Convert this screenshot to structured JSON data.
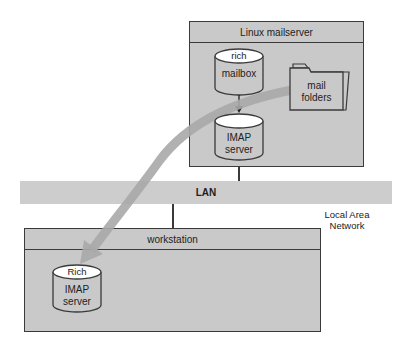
{
  "server": {
    "title": "Linux mailserver",
    "mailbox": {
      "top_label": "rich",
      "label": "mailbox"
    },
    "imap": {
      "line1": "IMAP",
      "line2": "server"
    },
    "folders": {
      "line1": "mail",
      "line2": "folders"
    }
  },
  "network": {
    "band_label": "LAN",
    "caption": "Local Area Network"
  },
  "workstation": {
    "title": "workstation",
    "imap": {
      "top_label": "Rich",
      "line1": "IMAP",
      "line2": "server"
    }
  },
  "colors": {
    "box_fill": "#c9c9c9",
    "border": "#3a3a3a",
    "lan_band": "#cdcdcd",
    "flow_arrow": "#a9a9a9"
  }
}
